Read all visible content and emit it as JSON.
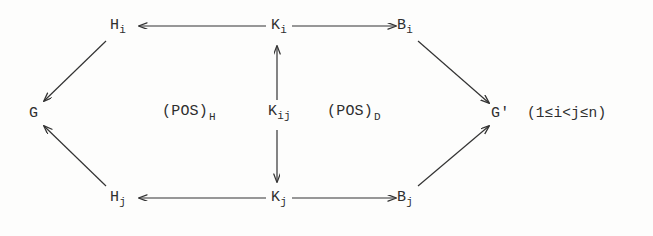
{
  "diagram": {
    "type": "commutative-diagram",
    "ink_color": "#2e2e2e",
    "background_color": "#fdfdfc",
    "nodes": [
      {
        "id": "H_i",
        "base": "H",
        "sub": "i",
        "x": 117,
        "y": 26
      },
      {
        "id": "K_i",
        "base": "K",
        "sub": "i",
        "x": 277,
        "y": 26
      },
      {
        "id": "B_i",
        "base": "B",
        "sub": "i",
        "x": 403,
        "y": 26
      },
      {
        "id": "G",
        "base": "G",
        "sub": "",
        "x": 35,
        "y": 114
      },
      {
        "id": "K_ij",
        "base": "K",
        "sub": "ij",
        "x": 277,
        "y": 112
      },
      {
        "id": "G'",
        "base": "G'",
        "sub": "",
        "x": 498,
        "y": 114
      },
      {
        "id": "H_j",
        "base": "H",
        "sub": "j",
        "x": 117,
        "y": 198
      },
      {
        "id": "K_j",
        "base": "K",
        "sub": "j",
        "x": 277,
        "y": 198
      },
      {
        "id": "B_j",
        "base": "B",
        "sub": "j",
        "x": 403,
        "y": 198
      }
    ],
    "region_labels": [
      {
        "id": "POS_H",
        "base": "(POS)",
        "sub": "H",
        "x": 162,
        "y": 112
      },
      {
        "id": "POS_D",
        "base": "(POS)",
        "sub": "D",
        "x": 327,
        "y": 112
      }
    ],
    "condition": "(1≤i<j≤n)",
    "arrows": [
      {
        "id": "ki-to-hi",
        "from": "K_i",
        "to": "H_i",
        "direction": "left",
        "style": "solid"
      },
      {
        "id": "ki-to-bi",
        "from": "K_i",
        "to": "B_i",
        "direction": "right",
        "style": "solid"
      },
      {
        "id": "kj-to-hj",
        "from": "K_j",
        "to": "H_j",
        "direction": "left",
        "style": "solid"
      },
      {
        "id": "kj-to-bj",
        "from": "K_j",
        "to": "B_j",
        "direction": "right",
        "style": "solid"
      },
      {
        "id": "kij-to-ki",
        "from": "K_ij",
        "to": "K_i",
        "direction": "up",
        "style": "solid"
      },
      {
        "id": "kij-to-kj",
        "from": "K_ij",
        "to": "K_j",
        "direction": "down",
        "style": "solid"
      },
      {
        "id": "hi-to-g",
        "from": "H_i",
        "to": "G",
        "direction": "down-left",
        "style": "solid"
      },
      {
        "id": "hj-to-g",
        "from": "H_j",
        "to": "G",
        "direction": "up-left",
        "style": "solid"
      },
      {
        "id": "bi-to-gp",
        "from": "B_i",
        "to": "G'",
        "direction": "down-right",
        "style": "solid"
      },
      {
        "id": "bj-to-gp",
        "from": "B_j",
        "to": "G'",
        "direction": "up-right",
        "style": "solid"
      }
    ]
  },
  "nodes": {
    "h_i": {
      "base": "H",
      "sub": "i"
    },
    "k_i": {
      "base": "K",
      "sub": "i"
    },
    "b_i": {
      "base": "B",
      "sub": "i"
    },
    "g": {
      "base": "G",
      "sub": ""
    },
    "k_ij": {
      "base": "K",
      "sub": "ij"
    },
    "g_prime": {
      "base": "G'",
      "sub": ""
    },
    "h_j": {
      "base": "H",
      "sub": "j"
    },
    "k_j": {
      "base": "K",
      "sub": "j"
    },
    "b_j": {
      "base": "B",
      "sub": "j"
    }
  },
  "labels": {
    "pos_h": {
      "base": "(POS)",
      "sub": "H"
    },
    "pos_d": {
      "base": "(POS)",
      "sub": "D"
    }
  },
  "condition": {
    "text": "(1≤i<j≤n)"
  }
}
